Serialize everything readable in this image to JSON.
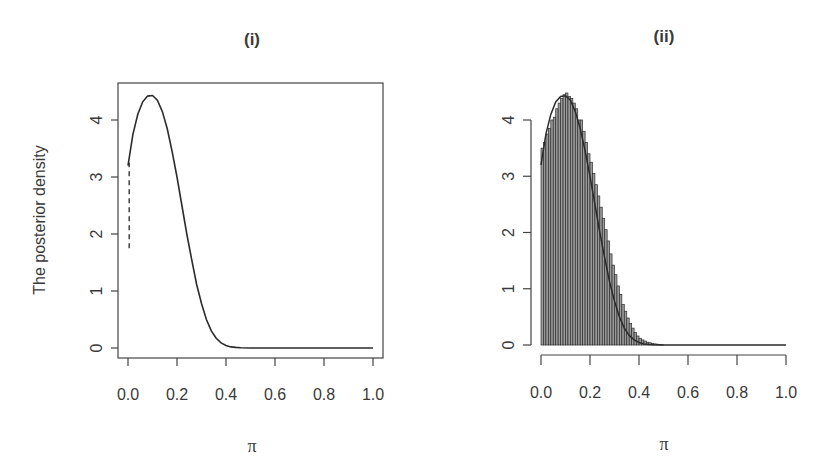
{
  "chart_data": [
    {
      "type": "line",
      "title": "(i)",
      "xlabel": "π",
      "ylabel": "The posterior density",
      "xlim": [
        0,
        1
      ],
      "ylim": [
        0,
        4.5
      ],
      "x_ticks": [
        "0.0",
        "0.2",
        "0.4",
        "0.6",
        "0.8",
        "1.0"
      ],
      "y_ticks": [
        "0",
        "1",
        "2",
        "3",
        "4"
      ],
      "grid": false,
      "box": true,
      "series": [
        {
          "name": "posterior density (solid)",
          "style": "solid",
          "x": [
            0.0,
            0.02,
            0.04,
            0.06,
            0.08,
            0.1,
            0.12,
            0.14,
            0.16,
            0.18,
            0.2,
            0.22,
            0.24,
            0.26,
            0.28,
            0.3,
            0.32,
            0.34,
            0.36,
            0.38,
            0.4,
            0.42,
            0.44,
            0.46,
            0.5,
            0.6,
            0.7,
            0.8,
            0.9,
            1.0
          ],
          "values": [
            3.2,
            3.75,
            4.1,
            4.32,
            4.42,
            4.43,
            4.35,
            4.15,
            3.85,
            3.45,
            3.0,
            2.5,
            2.0,
            1.55,
            1.12,
            0.78,
            0.5,
            0.3,
            0.17,
            0.09,
            0.045,
            0.02,
            0.01,
            0.005,
            0.0,
            0.0,
            0.0,
            0.0,
            0.0,
            0.0
          ]
        },
        {
          "name": "approximation (dashed)",
          "style": "dashed",
          "x": [
            0.005,
            0.005,
            0.02,
            0.06,
            0.1,
            0.14,
            0.2,
            0.26,
            0.3,
            0.36,
            0.4,
            0.46,
            1.0
          ],
          "values": [
            1.75,
            3.25,
            3.75,
            4.32,
            4.43,
            4.15,
            3.0,
            1.55,
            0.78,
            0.17,
            0.045,
            0.005,
            0.0
          ]
        }
      ]
    },
    {
      "type": "bar",
      "subtype": "histogram with density curve",
      "title": "(ii)",
      "xlabel": "π",
      "ylabel": "",
      "xlim": [
        0,
        1
      ],
      "ylim": [
        0,
        4.5
      ],
      "x_ticks": [
        "0.0",
        "0.2",
        "0.4",
        "0.6",
        "0.8",
        "1.0"
      ],
      "y_ticks": [
        "0",
        "1",
        "2",
        "3",
        "4"
      ],
      "grid": false,
      "box": false,
      "bin_width": 0.01,
      "histogram": {
        "bin_start": 0.0,
        "values": [
          3.5,
          3.6,
          3.75,
          3.85,
          4.0,
          4.05,
          4.2,
          4.3,
          4.38,
          4.45,
          4.48,
          4.42,
          4.38,
          4.3,
          4.2,
          4.0,
          4.0,
          3.8,
          3.6,
          3.4,
          3.25,
          3.05,
          2.85,
          2.65,
          2.45,
          2.25,
          2.05,
          1.85,
          1.62,
          1.42,
          1.25,
          1.05,
          0.9,
          0.72,
          0.6,
          0.48,
          0.38,
          0.3,
          0.22,
          0.16,
          0.12,
          0.09,
          0.07,
          0.05,
          0.04,
          0.03,
          0.02,
          0.015,
          0.01,
          0.005
        ]
      },
      "series": [
        {
          "name": "density curve",
          "style": "solid",
          "x": [
            0.0,
            0.02,
            0.04,
            0.06,
            0.08,
            0.1,
            0.12,
            0.14,
            0.16,
            0.18,
            0.2,
            0.22,
            0.24,
            0.26,
            0.28,
            0.3,
            0.32,
            0.34,
            0.36,
            0.38,
            0.4,
            0.42,
            0.44,
            0.46,
            0.5,
            0.6,
            0.7,
            0.8,
            0.9,
            1.0
          ],
          "values": [
            3.2,
            3.75,
            4.1,
            4.32,
            4.42,
            4.43,
            4.35,
            4.15,
            3.85,
            3.45,
            3.0,
            2.5,
            2.0,
            1.55,
            1.12,
            0.78,
            0.5,
            0.3,
            0.17,
            0.09,
            0.045,
            0.02,
            0.01,
            0.005,
            0.0,
            0.0,
            0.0,
            0.0,
            0.0,
            0.0
          ]
        }
      ]
    }
  ],
  "panels": {
    "left": {
      "title": "(i)",
      "xlabel": "π",
      "ylabel": "The posterior density"
    },
    "right": {
      "title": "(ii)",
      "xlabel": "π"
    }
  },
  "colors": {
    "line": "#2b2b2b",
    "axis": "#444444",
    "bar_fill": "#8c8c8c",
    "bar_edge": "#2e2e2e",
    "text": "#3a3a3a"
  }
}
